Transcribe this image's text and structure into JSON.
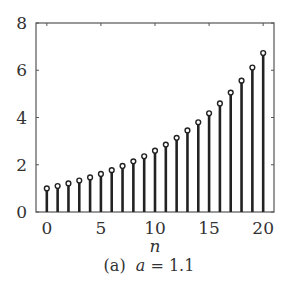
{
  "chart_data": {
    "type": "stem",
    "title": "",
    "xlabel": "n",
    "ylabel": "",
    "xlim": [
      -1,
      21
    ],
    "ylim": [
      0,
      8
    ],
    "xticks": [
      0,
      5,
      10,
      15,
      20
    ],
    "yticks": [
      0,
      2,
      4,
      6,
      8
    ],
    "grid": false,
    "legend": null,
    "x": [
      0,
      1,
      2,
      3,
      4,
      5,
      6,
      7,
      8,
      9,
      10,
      11,
      12,
      13,
      14,
      15,
      16,
      17,
      18,
      19,
      20
    ],
    "values": [
      1.0,
      1.1,
      1.21,
      1.331,
      1.4641,
      1.6105,
      1.7716,
      1.9487,
      2.1436,
      2.3579,
      2.5937,
      2.8531,
      3.1384,
      3.4523,
      3.7975,
      4.1772,
      4.595,
      5.0545,
      5.5599,
      6.1159,
      6.7275
    ],
    "caption": "(a)  a = 1.1",
    "parameter": {
      "name": "a",
      "value": 1.1
    }
  },
  "caption": {
    "label": "(a)",
    "var": "a",
    "eq": " = 1.1"
  }
}
